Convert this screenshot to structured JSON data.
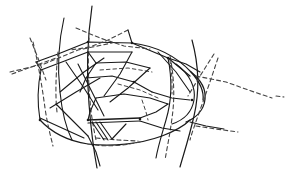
{
  "figure": {
    "caption": "",
    "background_color": "#ffffff",
    "stroke_color": "#1a1a1a",
    "stroke_color_light": "#444444",
    "canvas": {
      "width": 295,
      "height": 170
    },
    "legend": {
      "solid_meaning": "visible edge",
      "dashed_meaning": "hidden edge"
    }
  },
  "chart_data": {
    "type": "line",
    "xlabel": "",
    "ylabel": "",
    "xlim": [
      0,
      295
    ],
    "ylim": [
      0,
      170
    ],
    "grid": false,
    "legend_position": "none",
    "series": [
      {
        "name": "outer-top-contour",
        "style": "solid",
        "width": 1.2,
        "points": "M 36,62 L 58,54 L 88,42 L 132,43 L 168,58 L 190,76"
      },
      {
        "name": "outer-upper-rim",
        "style": "solid",
        "width": 1.2,
        "points": "M 41,70 L 62,62 L 88,52 L 132,52"
      },
      {
        "name": "upper-rim-closure-left",
        "style": "solid",
        "width": 1.1,
        "points": "M 36,62 L 41,70"
      },
      {
        "name": "crown-sweep-right",
        "style": "solid",
        "width": 1.2,
        "points": "M 132,43 C 156,46 176,56 191,72 C 200,82 204,92 203,100"
      },
      {
        "name": "nose-outer-bulge",
        "style": "solid",
        "width": 1.3,
        "points": "M 191,72 C 201,80 206,90 205,99 C 204,110 196,118 186,122"
      },
      {
        "name": "nose-inner-curve",
        "style": "solid",
        "width": 1.1,
        "points": "M 176,64 C 190,74 196,88 194,100 C 192,112 184,120 172,124"
      },
      {
        "name": "lower-outer-contour",
        "style": "solid",
        "width": 1.2,
        "points": "M 40,120 C 52,133 68,141 88,144 C 112,147 140,144 162,136 C 175,131 184,126 190,120"
      },
      {
        "name": "lower-outer-contour-dashed-tail",
        "style": "dashed",
        "dash": "4,3",
        "width": 1.1,
        "points": "M 88,144 C 104,147 122,146 140,142"
      },
      {
        "name": "left-flank-curve",
        "style": "solid",
        "width": 1.1,
        "points": "M 41,70 C 38,84 37,102 40,120"
      },
      {
        "name": "long-vertical-curve-left",
        "style": "solid",
        "width": 1.2,
        "points": "M 92,6 C 88,34 86,70 89,104 C 91,130 94,152 97,168"
      },
      {
        "name": "long-vertical-curve-left-2",
        "style": "solid",
        "width": 1.1,
        "points": "M 64,18 C 59,40 57,66 60,92 C 62,112 66,128 72,140"
      },
      {
        "name": "long-vertical-curve-right",
        "style": "solid",
        "width": 1.2,
        "points": "M 192,40 C 198,62 200,90 194,116 C 189,138 183,156 180,167"
      },
      {
        "name": "mid-vertical-curve",
        "style": "solid",
        "width": 1.1,
        "points": "M 168,58 C 172,78 172,100 166,120 C 162,134 158,146 156,158"
      },
      {
        "name": "dashed-vertical-far-left",
        "style": "dashed",
        "dash": "4,3",
        "width": 1.1,
        "points": "M 33,42 C 38,62 42,86 45,108 C 47,122 50,134 53,146"
      },
      {
        "name": "dashed-vertical-inner-left",
        "style": "dashed",
        "dash": "4,3",
        "width": 1.1,
        "points": "M 58,52 C 56,72 55,94 57,112"
      },
      {
        "name": "dashed-vertical-mid",
        "style": "dashed",
        "dash": "4,3",
        "width": 1.1,
        "points": "M 89,38 C 88,58 88,80 90,100 C 91,116 94,130 96,140"
      },
      {
        "name": "dashed-vertical-right",
        "style": "dashed",
        "dash": "4,3",
        "width": 1.1,
        "points": "M 170,56 C 174,76 175,98 172,118 C 170,134 167,148 165,160"
      },
      {
        "name": "dashed-vertical-far-right",
        "style": "dashed",
        "dash": "4,3",
        "width": 1.1,
        "points": "M 218,58 C 212,76 206,94 200,110 C 196,122 192,132 190,140"
      },
      {
        "name": "dashed-ray-upper-left",
        "style": "dashed",
        "dash": "4,3",
        "width": 1.1,
        "points": "M 10,72 L 44,64 L 78,50 L 112,43"
      },
      {
        "name": "dashed-ray-upper-right",
        "style": "dashed",
        "dash": "4,3",
        "width": 1.1,
        "points": "M 76,28 L 100,38 L 124,46 L 150,49"
      },
      {
        "name": "dashed-ray-crossing",
        "style": "dashed",
        "dash": "4,3",
        "width": 1.1,
        "points": "M 128,30 L 108,40 L 90,47 L 70,50"
      },
      {
        "name": "dashed-ray-mid-right",
        "style": "dashed",
        "dash": "4,3",
        "width": 1.1,
        "points": "M 196,76 L 226,82 L 254,92 L 272,98"
      },
      {
        "name": "dashed-ray-lower-right",
        "style": "dashed",
        "dash": "4,3",
        "width": 1.1,
        "points": "M 196,126 L 216,129 L 238,132"
      },
      {
        "name": "dashed-ray-lower-left",
        "style": "dashed",
        "dash": "4,3",
        "width": 1.1,
        "points": "M 96,138 L 118,140 L 138,141"
      },
      {
        "name": "dashed-fragment-far-right",
        "style": "dashed",
        "dash": "4,3",
        "width": 1.1,
        "points": "M 276,96 L 284,97"
      },
      {
        "name": "inner-panel-top-edge",
        "style": "solid",
        "width": 1.2,
        "points": "M 88,52 L 96,63 L 126,62 L 150,68"
      },
      {
        "name": "inner-panel-dashed-edge",
        "style": "dashed",
        "dash": "3.5,3",
        "width": 1.0,
        "points": "M 100,70 L 128,68 L 152,72"
      },
      {
        "name": "inner-panel-left-edge",
        "style": "solid",
        "width": 1.1,
        "points": "M 96,63 L 86,78 L 80,92"
      },
      {
        "name": "inner-ridge-upper",
        "style": "solid",
        "width": 1.2,
        "points": "M 86,78 L 112,76 L 134,82 L 152,92"
      },
      {
        "name": "inner-ridge-upper-right",
        "style": "solid",
        "width": 1.1,
        "points": "M 152,92 L 172,98 L 190,100"
      },
      {
        "name": "inner-ridge-dashed",
        "style": "dashed",
        "dash": "3.5,3",
        "width": 1.0,
        "points": "M 118,84 L 140,90 L 158,98"
      },
      {
        "name": "inner-diagonal-a",
        "style": "solid",
        "width": 1.1,
        "points": "M 150,68 L 128,88 L 110,102"
      },
      {
        "name": "inner-diagonal-b",
        "style": "solid",
        "width": 1.1,
        "points": "M 132,52 L 120,74 L 104,96"
      },
      {
        "name": "inner-diagonal-c",
        "style": "solid",
        "width": 1.1,
        "points": "M 60,92 L 84,72 L 104,58"
      },
      {
        "name": "inner-diagonal-d",
        "style": "solid",
        "width": 1.1,
        "points": "M 50,108 L 76,92 L 100,78"
      },
      {
        "name": "inner-diagonal-e",
        "style": "solid",
        "width": 1.1,
        "points": "M 66,62 L 84,88 L 98,110"
      },
      {
        "name": "inner-diagonal-f",
        "style": "solid",
        "width": 1.1,
        "points": "M 78,64 L 92,92 L 104,116"
      },
      {
        "name": "mid-panel-upper",
        "style": "solid",
        "width": 1.2,
        "points": "M 96,98 L 124,94 L 150,98 L 168,104"
      },
      {
        "name": "mid-panel-left",
        "style": "solid",
        "width": 1.1,
        "points": "M 96,98 L 90,112 L 88,120"
      },
      {
        "name": "mid-panel-bottom-bar",
        "style": "solid",
        "width": 1.5,
        "points": "M 88,120 L 140,118"
      },
      {
        "name": "mid-panel-bottom-bar-2",
        "style": "solid",
        "width": 1.2,
        "points": "M 88,123 L 140,121"
      },
      {
        "name": "mid-panel-right-edge",
        "style": "solid",
        "width": 1.1,
        "points": "M 140,118 L 156,112 L 168,104"
      },
      {
        "name": "mid-panel-dashed-right",
        "style": "dashed",
        "dash": "3.5,3",
        "width": 1.0,
        "points": "M 142,100 L 146,112 L 148,120"
      },
      {
        "name": "lower-bar-to-nose",
        "style": "solid",
        "width": 1.2,
        "points": "M 140,121 L 162,128 L 180,131"
      },
      {
        "name": "finger-stroke-1",
        "style": "solid",
        "width": 1.1,
        "points": "M 92,122 L 104,140"
      },
      {
        "name": "finger-stroke-2",
        "style": "solid",
        "width": 1.1,
        "points": "M 96,122 L 108,140"
      },
      {
        "name": "finger-stroke-3",
        "style": "solid",
        "width": 1.1,
        "points": "M 100,122 L 112,139"
      },
      {
        "name": "finger-base-diagonal",
        "style": "solid",
        "width": 1.1,
        "points": "M 112,139 L 126,124"
      },
      {
        "name": "left-lower-spur",
        "style": "solid",
        "width": 1.1,
        "points": "M 40,118 L 62,128 L 84,138"
      },
      {
        "name": "left-lower-spur-2",
        "style": "solid",
        "width": 1.1,
        "points": "M 56,104 L 74,122 L 88,136"
      },
      {
        "name": "bottom-tail-stroke",
        "style": "solid",
        "width": 1.1,
        "points": "M 88,136 L 96,152 L 100,166"
      },
      {
        "name": "right-lower-branch",
        "style": "solid",
        "width": 1.1,
        "points": "M 190,122 L 206,126 L 224,129"
      },
      {
        "name": "right-upper-branch",
        "style": "solid",
        "width": 1.1,
        "points": "M 168,58 L 186,64 L 200,72"
      },
      {
        "name": "right-diagonal-spur",
        "style": "solid",
        "width": 1.1,
        "points": "M 158,52 L 176,72 L 190,92"
      },
      {
        "name": "right-dashed-spur",
        "style": "dashed",
        "dash": "4,3",
        "width": 1.1,
        "points": "M 214,54 L 200,76 L 188,96"
      },
      {
        "name": "right-panel-dashed-edge",
        "style": "dashed",
        "dash": "3.5,3",
        "width": 1.0,
        "points": "M 170,60 L 172,78 L 172,94"
      },
      {
        "name": "top-short-stroke",
        "style": "solid",
        "width": 1.1,
        "points": "M 132,43 L 128,30"
      },
      {
        "name": "upper-left-dashed-cross-a",
        "style": "dashed",
        "dash": "4,3",
        "width": 1.1,
        "points": "M 30,38 L 38,58 L 46,80"
      },
      {
        "name": "upper-left-dashed-cross-b",
        "style": "dashed",
        "dash": "4,3",
        "width": 1.1,
        "points": "M 12,74 L 34,66 L 56,58"
      }
    ],
    "nodes": [
      {
        "name": "node-top-apex",
        "x": 88,
        "y": 42
      },
      {
        "name": "node-top-right",
        "x": 132,
        "y": 43
      },
      {
        "name": "node-right-shoulder",
        "x": 168,
        "y": 58
      },
      {
        "name": "node-nose-tip",
        "x": 192,
        "y": 100
      },
      {
        "name": "node-ridge-mid",
        "x": 134,
        "y": 82
      },
      {
        "name": "node-bar-left",
        "x": 88,
        "y": 120
      },
      {
        "name": "node-bar-right",
        "x": 140,
        "y": 119
      },
      {
        "name": "node-lower-left",
        "x": 40,
        "y": 120
      }
    ]
  }
}
